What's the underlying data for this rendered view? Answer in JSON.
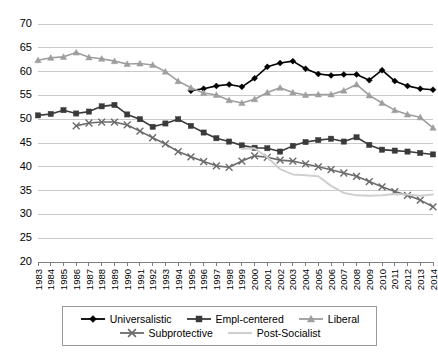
{
  "chart_data": {
    "type": "line",
    "title": "",
    "xlabel": "",
    "ylabel": "",
    "ylim": [
      20,
      70
    ],
    "ytick_step": 5,
    "yticks": [
      20,
      25,
      30,
      35,
      40,
      45,
      50,
      55,
      60,
      65,
      70
    ],
    "grid": true,
    "legend_position": "bottom",
    "categories": [
      1983,
      1984,
      1985,
      1986,
      1987,
      1988,
      1989,
      1990,
      1991,
      1992,
      1993,
      1994,
      1995,
      1996,
      1997,
      1998,
      1999,
      2000,
      2001,
      2002,
      2003,
      2004,
      2005,
      2006,
      2007,
      2008,
      2009,
      2010,
      2011,
      2012,
      2013,
      2014
    ],
    "series": [
      {
        "name": "Universalistic",
        "color": "#000000",
        "marker": "diamond",
        "values": [
          null,
          null,
          null,
          null,
          null,
          null,
          null,
          null,
          null,
          null,
          null,
          null,
          56.0,
          56.4,
          57.0,
          57.3,
          56.8,
          58.6,
          61.0,
          61.8,
          62.2,
          60.6,
          59.5,
          59.2,
          59.4,
          59.4,
          58.2,
          60.3,
          58.0,
          57.0,
          56.4,
          56.2
        ]
      },
      {
        "name": "Empl-centered",
        "color": "#3a3a3a",
        "marker": "square",
        "values": [
          50.8,
          51.1,
          51.9,
          51.2,
          51.6,
          52.7,
          53.0,
          51.0,
          50.0,
          48.4,
          49.1,
          50.0,
          48.6,
          47.2,
          46.0,
          45.3,
          44.5,
          44.0,
          43.9,
          43.2,
          44.4,
          45.2,
          45.6,
          45.9,
          45.3,
          46.2,
          44.6,
          43.6,
          43.4,
          43.2,
          42.9,
          42.6
        ]
      },
      {
        "name": "Liberal",
        "color": "#9e9e9e",
        "marker": "triangle",
        "values": [
          62.4,
          62.9,
          63.1,
          64.0,
          63.0,
          62.7,
          62.2,
          61.6,
          61.7,
          61.4,
          60.0,
          58.0,
          56.6,
          55.5,
          55.1,
          54.0,
          53.4,
          54.2,
          55.6,
          56.6,
          55.6,
          55.1,
          55.2,
          55.2,
          56.0,
          57.3,
          55.0,
          53.4,
          51.9,
          51.0,
          50.4,
          48.2
        ]
      },
      {
        "name": "Subprotective",
        "color": "#6b6b6b",
        "marker": "x",
        "values": [
          null,
          null,
          null,
          48.6,
          49.2,
          49.4,
          49.4,
          48.8,
          47.5,
          46.1,
          44.8,
          43.2,
          42.1,
          41.1,
          40.2,
          39.9,
          41.2,
          42.3,
          42.0,
          41.4,
          41.2,
          40.6,
          40.0,
          39.4,
          38.7,
          38.0,
          36.9,
          35.8,
          34.8,
          34.0,
          33.0,
          31.6
        ]
      },
      {
        "name": "Post-Socialist",
        "color": "#cfcfcf",
        "marker": "none",
        "values": [
          null,
          null,
          null,
          null,
          null,
          null,
          null,
          null,
          null,
          null,
          null,
          null,
          null,
          null,
          null,
          null,
          43.8,
          43.9,
          42.0,
          39.5,
          38.4,
          38.2,
          38.0,
          36.0,
          34.5,
          34.0,
          33.9,
          34.0,
          34.3,
          34.2,
          33.9,
          34.2
        ]
      }
    ]
  },
  "legend": {
    "rows": [
      [
        {
          "label": "Universalistic",
          "marker": "diamond",
          "color": "#000000"
        },
        {
          "label": "Empl-centered",
          "marker": "square",
          "color": "#3a3a3a"
        },
        {
          "label": "Liberal",
          "marker": "triangle",
          "color": "#9e9e9e"
        }
      ],
      [
        {
          "label": "Subprotective",
          "marker": "x",
          "color": "#6b6b6b"
        },
        {
          "label": "Post-Socialist",
          "marker": "none",
          "color": "#cfcfcf"
        }
      ]
    ]
  }
}
